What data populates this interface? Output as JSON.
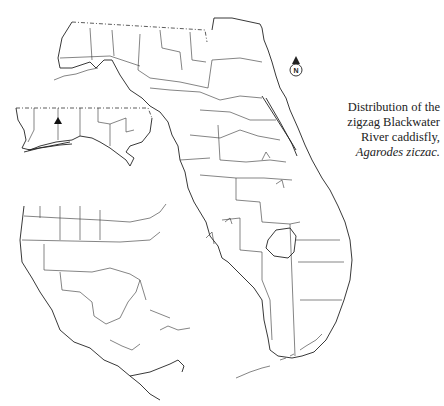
{
  "caption": {
    "line1": "Distribution of the",
    "line2": "zigzag Blackwater",
    "line3": "River caddisfly,",
    "species": "Agarodes ziczac."
  },
  "compass": {
    "label": "N",
    "icon": "north-arrow-icon"
  },
  "maps": {
    "main": "Florida counties",
    "inset_panhandle": "Western Florida panhandle enlargement",
    "inset_region": "North America, Central America and Caribbean"
  },
  "markers": [
    {
      "type": "triangle",
      "meaning": "record locality",
      "map": "inset_panhandle"
    }
  ],
  "colors": {
    "ink": "#222222",
    "background": "#ffffff"
  }
}
